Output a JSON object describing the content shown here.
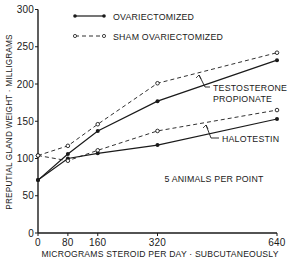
{
  "chart_data": {
    "type": "line",
    "title": "",
    "xlabel": "MICROGRAMS STEROID PER DAY · SUBCUTANEOUSLY",
    "ylabel": "PREPUTIAL GLAND WEIGHT · MILLIGRAMS",
    "xlim": [
      0,
      640
    ],
    "ylim": [
      0,
      300
    ],
    "x_ticks": [
      0,
      80,
      160,
      320,
      640
    ],
    "y_ticks": [
      0,
      50,
      100,
      150,
      200,
      250,
      300
    ],
    "grid": false,
    "legend_position": "top-left",
    "x": [
      0,
      80,
      160,
      320,
      640
    ],
    "series": [
      {
        "name": "Testosterone Propionate — Ovariectomized",
        "style": "solid",
        "marker": "filled-dot",
        "values": [
          71,
          106,
          137,
          177,
          232
        ]
      },
      {
        "name": "Testosterone Propionate — Sham Ovariectomized",
        "style": "dashed",
        "marker": "open-circle",
        "values": [
          104,
          117,
          146,
          201,
          242
        ]
      },
      {
        "name": "Halotestin — Ovariectomized",
        "style": "solid",
        "marker": "filled-dot",
        "values": [
          71,
          100,
          107,
          118,
          153
        ]
      },
      {
        "name": "Halotestin — Sham Ovariectomized",
        "style": "dashed",
        "marker": "open-circle",
        "values": [
          104,
          97,
          111,
          137,
          165
        ]
      }
    ],
    "legend": [
      {
        "label": "OVARIECTOMIZED",
        "style": "solid"
      },
      {
        "label": "SHAM OVARIECTOMIZED",
        "style": "dashed"
      }
    ],
    "annotations": [
      {
        "text_line1": "TESTOSTERONE",
        "text_line2": "PROPIONATE"
      },
      {
        "text_line1": "HALOTESTIN",
        "text_line2": ""
      },
      {
        "text_line1": "5 ANIMALS PER POINT",
        "text_line2": ""
      }
    ]
  }
}
